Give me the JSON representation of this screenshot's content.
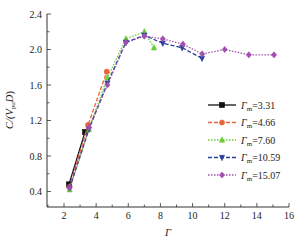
{
  "chart_data": {
    "type": "line",
    "title": "",
    "xlabel": "Γ",
    "ylabel": "C/(V_pu D)",
    "xlim": [
      1,
      16
    ],
    "ylim": [
      0.2,
      2.4
    ],
    "xticks": [
      2,
      4,
      6,
      8,
      10,
      12,
      14,
      16
    ],
    "yticks": [
      0.4,
      0.8,
      1.2,
      1.6,
      2.0,
      2.4
    ],
    "xtick_labels": [
      "2",
      "4",
      "6",
      "8",
      "10",
      "12",
      "14",
      "16"
    ],
    "ytick_labels": [
      "0.4",
      "0.8",
      "1.2",
      "1.6",
      "2.0",
      "2.4"
    ],
    "grid": false,
    "legend_position": "lower right",
    "series": [
      {
        "name": "Γm=3.31",
        "label_main": "Γ",
        "label_sub": "m",
        "label_value": "=3.31",
        "color": "#111111",
        "dash": "",
        "marker": "square",
        "x": [
          2.31,
          3.31
        ],
        "y": [
          0.48,
          1.07
        ]
      },
      {
        "name": "Γm=4.66",
        "label_main": "Γ",
        "label_sub": "m",
        "label_value": "=4.66",
        "color": "#e8643c",
        "dash": "4,2",
        "marker": "circle",
        "x": [
          2.33,
          3.5,
          4.66
        ],
        "y": [
          0.45,
          1.15,
          1.75
        ]
      },
      {
        "name": "Γm=7.60",
        "label_main": "Γ",
        "label_sub": "m",
        "label_value": "=7.60",
        "color": "#66cc33",
        "dash": "1.5,1.5",
        "marker": "triangle-up",
        "x": [
          2.35,
          3.55,
          4.7,
          5.85,
          7.0,
          7.6
        ],
        "y": [
          0.42,
          1.1,
          1.68,
          2.12,
          2.2,
          2.02
        ]
      },
      {
        "name": "Γm=10.59",
        "label_main": "Γ",
        "label_sub": "m",
        "label_value": "=10.59",
        "color": "#2a3f9e",
        "dash": "4,2",
        "marker": "triangle-down",
        "x": [
          2.35,
          3.55,
          4.7,
          5.85,
          7.0,
          8.15,
          9.35,
          10.59
        ],
        "y": [
          0.44,
          1.1,
          1.62,
          2.08,
          2.16,
          2.07,
          2.02,
          1.9
        ]
      },
      {
        "name": "Γm=15.07",
        "label_main": "Γ",
        "label_sub": "m",
        "label_value": "=15.07",
        "color": "#a34fb0",
        "dash": "1.5,1.5",
        "marker": "diamond",
        "x": [
          2.35,
          3.55,
          4.7,
          5.85,
          7.0,
          8.15,
          9.4,
          10.6,
          12.0,
          13.5,
          15.07
        ],
        "y": [
          0.44,
          1.12,
          1.6,
          2.08,
          2.15,
          2.12,
          2.06,
          1.95,
          2.0,
          1.94,
          1.94
        ]
      }
    ]
  }
}
